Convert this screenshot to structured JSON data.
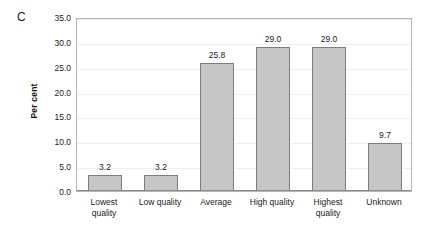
{
  "panel": {
    "label": "C"
  },
  "chart_data": {
    "type": "bar",
    "title": "",
    "subtitle": "",
    "xlabel": "",
    "ylabel": "Per cent",
    "ylim": [
      0.0,
      35.0
    ],
    "ytick_step": 5.0,
    "yticks": [
      "0.0",
      "5.0",
      "10.0",
      "15.0",
      "20.0",
      "25.0",
      "30.0",
      "35.0"
    ],
    "ytick_values": [
      0.0,
      5.0,
      10.0,
      15.0,
      20.0,
      25.0,
      30.0,
      35.0
    ],
    "grid": true,
    "legend": null,
    "categories": [
      "Lowest quality",
      "Low quality",
      "Average",
      "High quality",
      "Highest quality",
      "Unknown"
    ],
    "category_lines": [
      [
        "Lowest",
        "quality"
      ],
      [
        "Low quality"
      ],
      [
        "Average"
      ],
      [
        "High quality"
      ],
      [
        "Highest",
        "quality"
      ],
      [
        "Unknown"
      ]
    ],
    "values": [
      3.2,
      3.2,
      25.8,
      29.0,
      29.0,
      9.7
    ],
    "value_labels": [
      "3.2",
      "3.2",
      "25.8",
      "29.0",
      "29.0",
      "9.7"
    ],
    "colors": {
      "bar_fill": "#c6c6c6",
      "bar_edge": "#7d7d7d",
      "axis": "#8c8c8c",
      "frame": "#b4b4b4",
      "grid": "#f0f0f0",
      "text": "#1a1a1a",
      "background": "#ffffff"
    }
  }
}
